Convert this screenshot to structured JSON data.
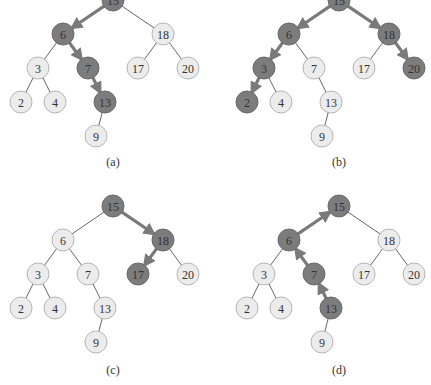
{
  "figure": {
    "colors": {
      "highlight": "#7c7c7c",
      "normal": "#ececec",
      "edge": "#555555",
      "path_arrow": "#7a7a7a"
    },
    "tree": {
      "nodes": [
        "15",
        "6",
        "18",
        "3",
        "7",
        "17",
        "20",
        "2",
        "4",
        "13",
        "9"
      ],
      "edges": [
        [
          "15",
          "6"
        ],
        [
          "15",
          "18"
        ],
        [
          "6",
          "3"
        ],
        [
          "6",
          "7"
        ],
        [
          "18",
          "17"
        ],
        [
          "18",
          "20"
        ],
        [
          "3",
          "2"
        ],
        [
          "3",
          "4"
        ],
        [
          "7",
          "13"
        ],
        [
          "13",
          "9"
        ]
      ]
    },
    "panels": [
      {
        "caption": "(a)",
        "highlighted": [
          "15",
          "6",
          "7",
          "13"
        ],
        "path": [
          [
            "15",
            "6"
          ],
          [
            "6",
            "7"
          ],
          [
            "7",
            "13"
          ]
        ],
        "direction": "down"
      },
      {
        "caption": "(b)",
        "highlighted": [
          "15",
          "6",
          "3",
          "2",
          "18",
          "20"
        ],
        "path": [
          [
            "15",
            "6"
          ],
          [
            "6",
            "3"
          ],
          [
            "3",
            "2"
          ],
          [
            "15",
            "18"
          ],
          [
            "18",
            "20"
          ]
        ],
        "direction": "down"
      },
      {
        "caption": "(c)",
        "highlighted": [
          "15",
          "18",
          "17"
        ],
        "path": [
          [
            "15",
            "18"
          ],
          [
            "18",
            "17"
          ]
        ],
        "direction": "down"
      },
      {
        "caption": "(d)",
        "highlighted": [
          "13",
          "7",
          "6",
          "15"
        ],
        "path": [
          [
            "13",
            "7"
          ],
          [
            "7",
            "6"
          ],
          [
            "6",
            "15"
          ]
        ],
        "direction": "up"
      }
    ]
  }
}
